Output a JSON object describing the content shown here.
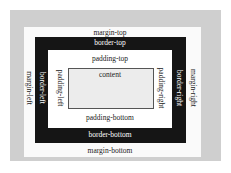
{
  "diagram": {
    "colors": {
      "outer": "#cfcfcf",
      "margin": "#fafafa",
      "border": "#151515",
      "padding": "#ffffff",
      "content": "#ececec"
    },
    "labels": {
      "content": "content",
      "padding_top": "padding-top",
      "padding_bottom": "padding-bottom",
      "padding_left": "padding-left",
      "padding_right": "padding-right",
      "border_top": "border-top",
      "border_bottom": "border-bottom",
      "border_left": "border-left",
      "border_right": "border-right",
      "margin_top": "margin-top",
      "margin_bottom": "margin-bottom",
      "margin_left": "margin-left",
      "margin_right": "margin-right"
    }
  }
}
